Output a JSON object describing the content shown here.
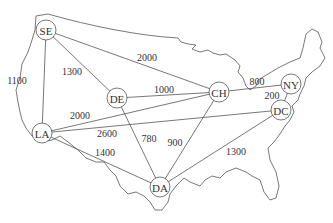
{
  "diagram": {
    "type": "weighted-graph-on-map",
    "background": "US map outline",
    "nodes": [
      {
        "id": "SE",
        "label": "SE",
        "x": 46,
        "y": 30
      },
      {
        "id": "DE",
        "label": "DE",
        "x": 117,
        "y": 98
      },
      {
        "id": "CH",
        "label": "CH",
        "x": 219,
        "y": 92
      },
      {
        "id": "NY",
        "label": "NY",
        "x": 291,
        "y": 84
      },
      {
        "id": "DC",
        "label": "DC",
        "x": 281,
        "y": 110
      },
      {
        "id": "LA",
        "label": "LA",
        "x": 42,
        "y": 133
      },
      {
        "id": "DA",
        "label": "DA",
        "x": 160,
        "y": 187
      }
    ],
    "edges": [
      {
        "from": "SE",
        "to": "LA",
        "weight": "1100",
        "lx": 17,
        "ly": 80
      },
      {
        "from": "SE",
        "to": "DE",
        "weight": "1300",
        "lx": 72,
        "ly": 71
      },
      {
        "from": "SE",
        "to": "CH",
        "weight": "2000",
        "lx": 147,
        "ly": 57
      },
      {
        "from": "DE",
        "to": "CH",
        "weight": "1000",
        "lx": 164,
        "ly": 89
      },
      {
        "from": "LA",
        "to": "CH",
        "weight": "2000",
        "lx": 80,
        "ly": 115
      },
      {
        "from": "LA",
        "to": "DC",
        "weight": "2600",
        "lx": 107,
        "ly": 133
      },
      {
        "from": "DE",
        "to": "DA",
        "weight": "780",
        "lx": 149,
        "ly": 138
      },
      {
        "from": "CH",
        "to": "DA",
        "weight": "900",
        "lx": 175,
        "ly": 142
      },
      {
        "from": "LA",
        "to": "DA",
        "weight": "1400",
        "lx": 105,
        "ly": 152
      },
      {
        "from": "CH",
        "to": "NY",
        "weight": "800",
        "lx": 257,
        "ly": 81
      },
      {
        "from": "NY",
        "to": "DC",
        "weight": "200",
        "lx": 272,
        "ly": 95
      },
      {
        "from": "DC",
        "to": "DA",
        "weight": "1300",
        "lx": 236,
        "ly": 151
      }
    ]
  }
}
